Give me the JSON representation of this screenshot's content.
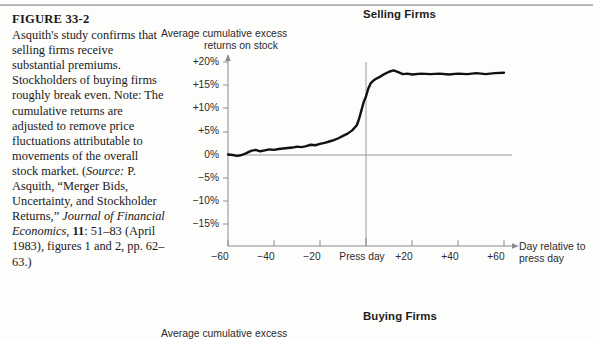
{
  "figure": {
    "number": "FIGURE 33-2",
    "caption_main": "Asquith's study confirms that selling firms receive substantial premiums. Stockholders of buying firms roughly break even. Note: The cumulative returns are adjusted to remove price fluctuations attributable to movements of the overall stock market.",
    "source_open": "(",
    "source_label": "Source:",
    "source_text_1": " P. Asquith, “Merger Bids, Uncertainty, and Stockholder Returns,” ",
    "source_journal": "Journal of Financial Economics,",
    "source_volume": " 11",
    "source_text_2": ": 51–83 (April 1983), figures 1 and 2, pp. 62–63.)"
  },
  "chart_data": [
    {
      "type": "line",
      "title": "Selling Firms",
      "ylabel": "Average cumulative excess returns on stock",
      "ylabel_line1": "Average cumulative excess",
      "ylabel_line2": "returns on stock",
      "xlabel": "Day relative to press day",
      "xlabel_line1": "Day relative to",
      "xlabel_line2": "press day",
      "ylim": [
        -15,
        20
      ],
      "xlim": [
        -60,
        60
      ],
      "yticks": [
        20,
        15,
        10,
        5,
        0,
        -5,
        -10,
        -15
      ],
      "ytick_labels": [
        "+20%",
        "+15%",
        "+10%",
        "+5%",
        "0%",
        "−5%",
        "−10%",
        "−15%"
      ],
      "xticks": [
        -60,
        -40,
        -20,
        0,
        20,
        40,
        60
      ],
      "xtick_labels": [
        "−60",
        "−40",
        "−20",
        "Press day",
        "+20",
        "+40",
        "+60"
      ],
      "grid": false,
      "zero_line": true,
      "event_line_x": 0,
      "series": [
        {
          "name": "Selling firms cumulative excess return",
          "x": [
            -60,
            -58,
            -56,
            -54,
            -52,
            -50,
            -48,
            -46,
            -44,
            -42,
            -40,
            -38,
            -36,
            -34,
            -32,
            -30,
            -28,
            -26,
            -24,
            -22,
            -20,
            -18,
            -16,
            -14,
            -12,
            -10,
            -8,
            -6,
            -4,
            -3,
            -2,
            -1,
            0,
            1,
            2,
            3,
            4,
            6,
            8,
            10,
            12,
            14,
            16,
            18,
            20,
            24,
            28,
            32,
            36,
            40,
            44,
            48,
            52,
            56,
            60
          ],
          "values": [
            0.1,
            0.0,
            -0.2,
            0.0,
            0.4,
            0.9,
            1.1,
            0.8,
            1.0,
            1.2,
            1.1,
            1.3,
            1.4,
            1.5,
            1.6,
            1.8,
            1.7,
            1.9,
            2.2,
            2.1,
            2.4,
            2.6,
            2.9,
            3.2,
            3.6,
            4.1,
            4.6,
            5.3,
            6.4,
            7.8,
            9.6,
            11.4,
            12.6,
            14.3,
            15.4,
            15.9,
            16.3,
            16.8,
            17.4,
            17.9,
            18.2,
            17.8,
            17.4,
            17.5,
            17.3,
            17.5,
            17.4,
            17.5,
            17.3,
            17.5,
            17.4,
            17.6,
            17.4,
            17.6,
            17.7
          ]
        }
      ]
    },
    {
      "type": "line",
      "title": "Buying Firms",
      "ylabel_line1": "Average cumulative excess",
      "ylabel_line2": "",
      "xlabel": "",
      "ylim": [
        -15,
        20
      ],
      "xlim": [
        -60,
        60
      ],
      "grid": false,
      "series": [
        {
          "name": "Buying firms cumulative excess return",
          "x": [],
          "values": []
        }
      ]
    }
  ]
}
